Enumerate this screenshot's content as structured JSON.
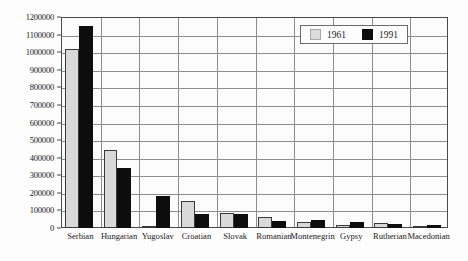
{
  "chart_data": {
    "type": "bar",
    "title": "",
    "subtitle": "",
    "xlabel": "",
    "ylabel": "",
    "ylim": [
      0,
      1200000
    ],
    "ytick_step": 100000,
    "grid": true,
    "legend_position": "top-right",
    "categories": [
      "Serbian",
      "Hungarian",
      "Yugoslav",
      "Croatian",
      "Slovak",
      "Romanian",
      "Montenegrin",
      "Gypsy",
      "Rutherian",
      "Macedonian"
    ],
    "ytick_labels": [
      "1200000",
      "1100000",
      "1000000",
      "900000",
      "800000",
      "700000",
      "600000",
      "500000",
      "400000",
      "300000",
      "200000",
      "100000",
      "0"
    ],
    "ytick_values": [
      1200000,
      1100000,
      1000000,
      900000,
      800000,
      700000,
      600000,
      500000,
      400000,
      300000,
      200000,
      100000,
      0
    ],
    "series": [
      {
        "name": "1961",
        "color": "#d9d9d9",
        "values": [
          1020000,
          442000,
          12000,
          155000,
          84000,
          62000,
          36000,
          18000,
          26000,
          14000
        ]
      },
      {
        "name": "1991",
        "color": "#0d0d0d",
        "values": [
          1150000,
          339000,
          183000,
          78000,
          78000,
          42000,
          48000,
          32000,
          23000,
          17000
        ]
      }
    ]
  },
  "legend": {
    "entries": [
      {
        "label": "1961"
      },
      {
        "label": "1991"
      }
    ]
  },
  "colors": {
    "series_1961": "#d9d9d9",
    "series_1991": "#0d0d0d",
    "axis": "#4a4a4a",
    "gridline": "#8d8d8d",
    "background": "#fdfdfd"
  }
}
